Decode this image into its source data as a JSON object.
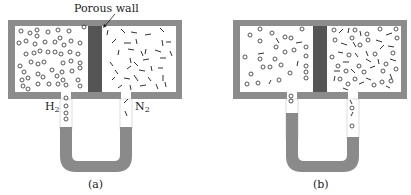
{
  "figure": {
    "annotation": "Porous wall",
    "panels": [
      {
        "caption": "(a)",
        "left_gas": {
          "symbol": "H",
          "subscript": "2"
        },
        "right_gas": {
          "symbol": "N",
          "subscript": "2"
        },
        "description": "H2 (circles) on left, N2 (dashes) on right; manometer levels equal"
      },
      {
        "caption": "(b)",
        "description": "Gases mixed after diffusion through porous wall; manometer level higher on left side"
      }
    ],
    "colors": {
      "container": "#8c8c8c",
      "porous_wall": "#555555",
      "fluid": "#8a8a8a",
      "molecules": "#444444"
    }
  }
}
